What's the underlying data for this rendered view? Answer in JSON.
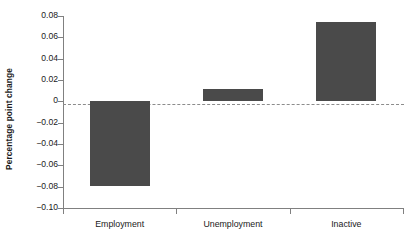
{
  "chart_data": {
    "type": "bar",
    "title": "",
    "xlabel": "",
    "ylabel": "Percentage point change",
    "categories": [
      "Employment",
      "Unemployment",
      "Inactive"
    ],
    "values": [
      -0.079,
      0.0115,
      0.074
    ],
    "ylim": [
      -0.1,
      0.08
    ],
    "yticks": [
      0.08,
      0.06,
      0.04,
      0.02,
      0,
      -0.02,
      -0.04,
      -0.06,
      -0.08,
      -0.1
    ],
    "ytick_labels": [
      "0.08",
      "0.06",
      "0.04",
      "0.02",
      "0",
      "-0.02",
      "-0.04",
      "-0.06",
      "-0.08",
      "-0.10"
    ],
    "grid": false,
    "legend": null,
    "zero_reference_line": true,
    "bar_color": "#4a4a4a",
    "axis_color": "#808080",
    "zero_line_color": "#8c8c8c",
    "background_color": "#ffffff"
  }
}
